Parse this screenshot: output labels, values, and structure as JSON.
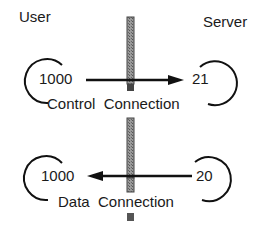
{
  "diagram": {
    "labels": {
      "user": "User",
      "server": "Server"
    },
    "control": {
      "client_port": "1000",
      "server_port": "21",
      "caption": "Control  Connection",
      "direction": "user-to-server"
    },
    "data": {
      "client_port": "1000",
      "server_port": "20",
      "caption": "Data  Connection",
      "direction": "server-to-user"
    },
    "colors": {
      "line": "#111111",
      "barrier": "#8a8a8a"
    }
  }
}
